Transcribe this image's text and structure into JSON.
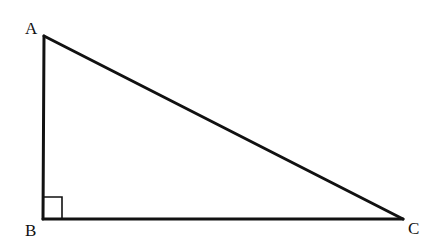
{
  "diagram": {
    "type": "right-triangle",
    "stroke_color": "#111111",
    "vertices": [
      {
        "label": "A",
        "x": 44,
        "y": 36
      },
      {
        "label": "B",
        "x": 43,
        "y": 219
      },
      {
        "label": "C",
        "x": 403,
        "y": 219
      }
    ],
    "labels": {
      "a": "A",
      "b": "B",
      "c": "C"
    },
    "right_angle_at": "B"
  }
}
